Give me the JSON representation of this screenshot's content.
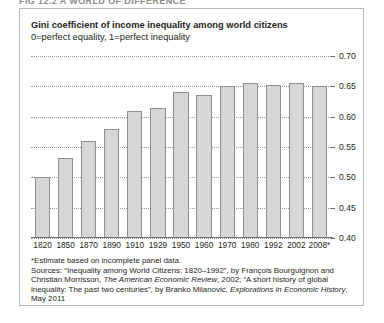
{
  "figure_caption": "FIG 12.2  A WORLD OF DIFFERENCE",
  "chart_data": {
    "type": "bar",
    "title": "Gini coefficient of income inequality among world citizens",
    "subtitle": "0=perfect equality, 1=perfect inequality",
    "xlabel": "",
    "ylabel": "",
    "categories": [
      "1820",
      "1850",
      "1870",
      "1890",
      "1910",
      "1929",
      "1950",
      "1960",
      "1970",
      "1980",
      "1992",
      "2002",
      "2008*"
    ],
    "values": [
      0.5,
      0.532,
      0.56,
      0.58,
      0.61,
      0.615,
      0.64,
      0.635,
      0.65,
      0.655,
      0.652,
      0.655,
      0.65
    ],
    "ylim": [
      0.4,
      0.7
    ],
    "ytick_labels": [
      "0.40",
      "0.45",
      "0.50",
      "0.55",
      "0.60",
      "0.65",
      "0.70"
    ],
    "ytick_values": [
      0.4,
      0.45,
      0.5,
      0.55,
      0.6,
      0.65,
      0.7
    ],
    "grid": true,
    "legend": null,
    "bar_color": "#d7d7d7",
    "bar_border_color": "#8f8f8f",
    "gridline_color": "#9a9a9a"
  },
  "notes": {
    "footnote": "*Estimate based on incomplete panel data.",
    "sources_line1_a": "Sources: “Inequality among World Citizens: 1820–1992”, by François Bourguignon and Christian",
    "sources_line2_a": "Morrisson, ",
    "sources_line2_italic": "The American Economic Review",
    "sources_line2_b": ", 2002; “A short history of global inequality: The past",
    "sources_line3_a": "two centuries”, by Branko Milanovic, ",
    "sources_line3_italic": "Explorations in Economic History",
    "sources_line3_b": ", May 2011"
  }
}
